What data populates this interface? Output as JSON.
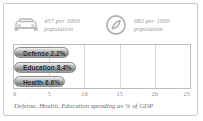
{
  "panel": {
    "background_color": "#ffffff",
    "border_color": "#c8c8c8"
  },
  "stats": [
    {
      "icon": "car-icon",
      "value_line1": "437 per 1000",
      "value_line2": "population"
    },
    {
      "icon": "telephone-icon",
      "value_line1": "682 per 1000",
      "value_line2": "population"
    }
  ],
  "chart_data": {
    "type": "bar",
    "orientation": "horizontal",
    "categories": [
      "Defense",
      "Education",
      "Health"
    ],
    "values": [
      2.2,
      8.4,
      6.6
    ],
    "bar_labels": [
      "Defense 2.2%",
      "Education 8.4%",
      "Health 6.6%"
    ],
    "title": "",
    "xlabel": "Defense, Health, Education spending as % of GDP",
    "ylabel": "",
    "xlim": [
      0,
      25
    ],
    "tick_labels": [
      "0",
      "5",
      "10",
      "15",
      "20",
      "25"
    ],
    "tick_values": [
      0,
      5,
      10,
      15,
      20,
      25
    ],
    "grid": true,
    "legend": false,
    "bar_color": "#9f9f9f",
    "grid_color": "#d8d8d8"
  },
  "caption": "Defense, Health, Education spending as % of GDP"
}
